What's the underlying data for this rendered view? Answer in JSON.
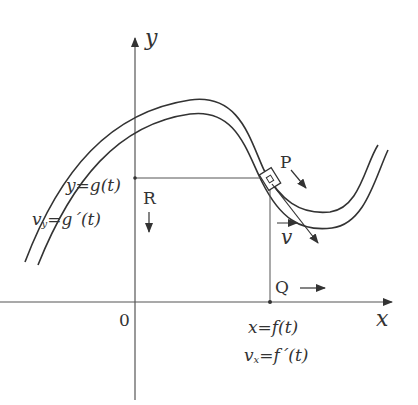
{
  "diagram": {
    "type": "parametric-motion-on-curve",
    "axes": {
      "x_label": "x",
      "y_label": "y",
      "origin_label": "0"
    },
    "points": {
      "P": "P",
      "Q": "Q",
      "R": "R"
    },
    "vector_label": "v",
    "y_projection": {
      "position": "y=g(t)",
      "velocity_main": "v",
      "velocity_sub": "y",
      "velocity_rhs": "=g´(t)"
    },
    "x_projection": {
      "position": "x=f(t)",
      "velocity_main": "v",
      "velocity_sub": "x",
      "velocity_rhs": "=f´(t)"
    },
    "colors": {
      "line": "#333333",
      "background": "#ffffff"
    }
  }
}
